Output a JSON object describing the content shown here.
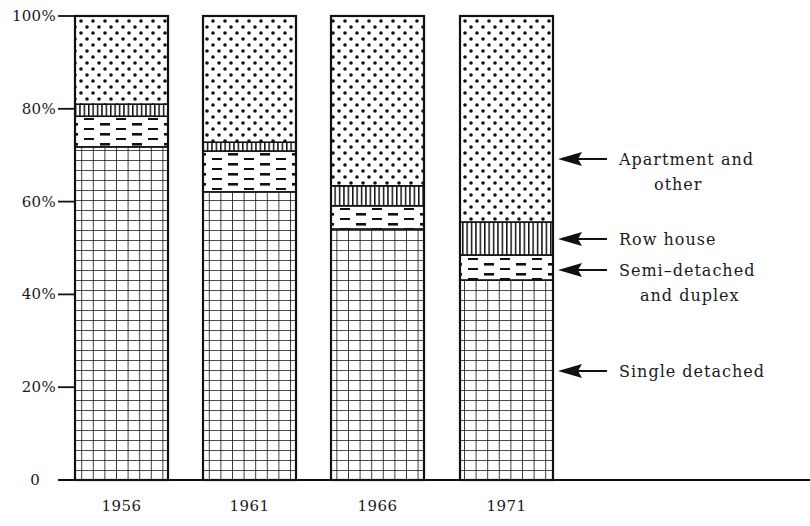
{
  "chart_data": {
    "type": "bar",
    "stacked": true,
    "normalized_percent": true,
    "title": "",
    "xlabel": "",
    "ylabel": "",
    "ylim": [
      0,
      100
    ],
    "categories": [
      "1956",
      "1961",
      "1966",
      "1971"
    ],
    "series": [
      {
        "name": "Single detached",
        "pattern": "grid",
        "values": [
          71.8,
          62.1,
          54.1,
          43.1
        ]
      },
      {
        "name": "Semi-detached and duplex",
        "pattern": "dashes",
        "values": [
          6.6,
          8.8,
          5.0,
          5.4
        ]
      },
      {
        "name": "Row house",
        "pattern": "vertical-lines",
        "values": [
          2.6,
          1.9,
          4.3,
          7.1
        ]
      },
      {
        "name": "Apartment and other",
        "pattern": "dots",
        "values": [
          19.0,
          27.2,
          36.6,
          44.4
        ]
      }
    ],
    "yticks": [
      {
        "value": 0,
        "label": "0"
      },
      {
        "value": 20,
        "label": "20%"
      },
      {
        "value": 40,
        "label": "40%"
      },
      {
        "value": 60,
        "label": "60%"
      },
      {
        "value": 80,
        "label": "80%"
      },
      {
        "value": 100,
        "label": "100%"
      }
    ],
    "grid": false,
    "legend": {
      "position": "right",
      "style": "arrows-to-last-bar",
      "entries": [
        {
          "series": "Apartment and other",
          "lines": [
            "Apartment and",
            "other"
          ],
          "arrow_y": 159
        },
        {
          "series": "Row house",
          "lines": [
            "Row house"
          ],
          "arrow_y": 239
        },
        {
          "series": "Semi-detached and duplex",
          "lines": [
            "Semi–detached",
            "and duplex"
          ],
          "arrow_y": 270
        },
        {
          "series": "Single detached",
          "lines": [
            "Single detached"
          ],
          "arrow_y": 371
        }
      ]
    }
  }
}
